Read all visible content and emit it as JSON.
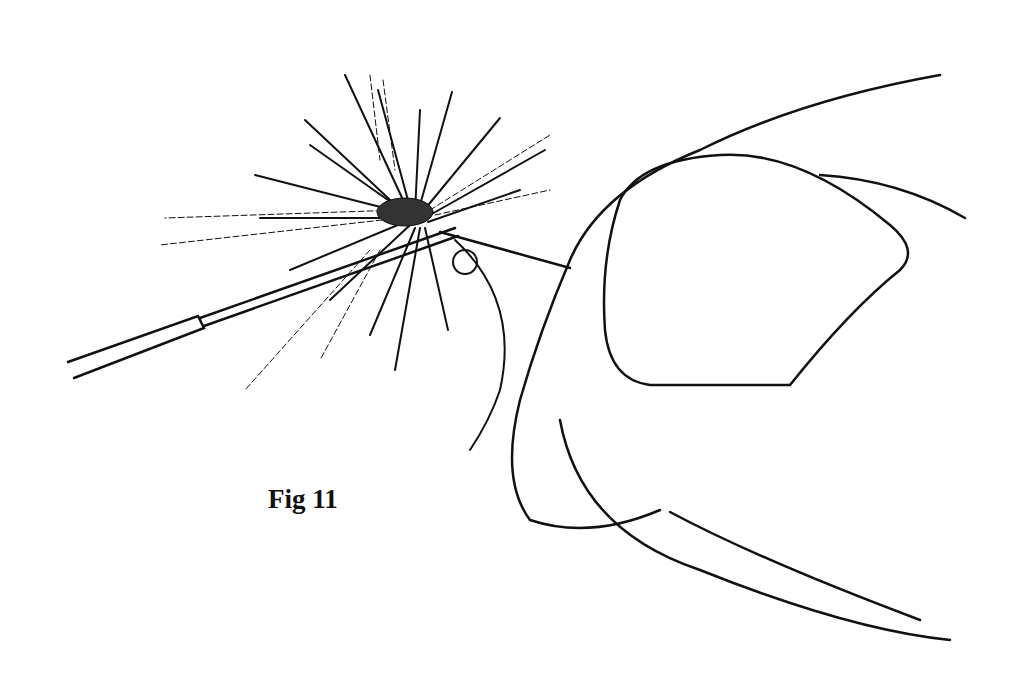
{
  "figure": {
    "caption": "Fig 11",
    "ink_color": "#111111",
    "background": "#ffffff"
  }
}
